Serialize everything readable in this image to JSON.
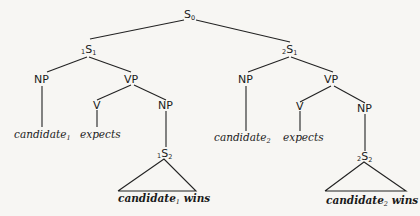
{
  "diagram": {
    "type": "syntax-tree",
    "nodes": {
      "root": {
        "label": "S",
        "sub": "0",
        "presub": ""
      },
      "s1_left": {
        "label": "S",
        "sub": "1",
        "presub": "1"
      },
      "s1_right": {
        "label": "S",
        "sub": "1",
        "presub": "2"
      },
      "np_l": {
        "label": "NP"
      },
      "vp_l": {
        "label": "VP"
      },
      "v_l": {
        "label": "V"
      },
      "np2_l": {
        "label": "NP"
      },
      "np_r": {
        "label": "NP"
      },
      "vp_r": {
        "label": "VP"
      },
      "v_r": {
        "label": "V"
      },
      "np2_r": {
        "label": "NP"
      },
      "s2_left": {
        "label": "S",
        "sub": "2",
        "presub": "1"
      },
      "s2_right": {
        "label": "S",
        "sub": "2",
        "presub": "2"
      }
    },
    "leaves": {
      "cand_l": {
        "word": "candidate",
        "sub": "1"
      },
      "expects_l": {
        "word": "expects"
      },
      "cand_r": {
        "word": "candidate",
        "sub": "2"
      },
      "expects_r": {
        "word": "expects"
      },
      "tri_l": {
        "word": "candidate",
        "sub": "1",
        "tail": " wins"
      },
      "tri_r": {
        "word": "candidate",
        "sub": "2",
        "tail": " wins"
      }
    }
  }
}
